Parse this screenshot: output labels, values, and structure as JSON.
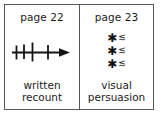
{
  "diagram": {
    "frame_border_color": "#55565a",
    "ink_color": "#1c1c1c",
    "background_color": "#ffffff",
    "shadow_color": "#d9d9d9",
    "pages": [
      {
        "number_label": "page 22",
        "caption_line_1": "written",
        "caption_line_2": "recount",
        "art": {
          "type": "timeline-arrow",
          "description": "horizontal arrow pointing right crossed by four vertical tick marks",
          "tick_count": 4,
          "arrow_direction": "right"
        }
      },
      {
        "number_label": "page 23",
        "caption_line_1": "visual",
        "caption_line_2": "persuasion",
        "art": {
          "type": "bulleted-symbol-list",
          "description": "three rows, each a star/asterisk bullet followed by a squiggle mark",
          "row_count": 3,
          "bullet_glyph": "✱",
          "mark_glyph": "≲",
          "rows": [
            {
              "bullet": "✱",
              "mark": "≲"
            },
            {
              "bullet": "✱",
              "mark": "≲"
            },
            {
              "bullet": "✱",
              "mark": "≲"
            }
          ]
        }
      }
    ]
  }
}
